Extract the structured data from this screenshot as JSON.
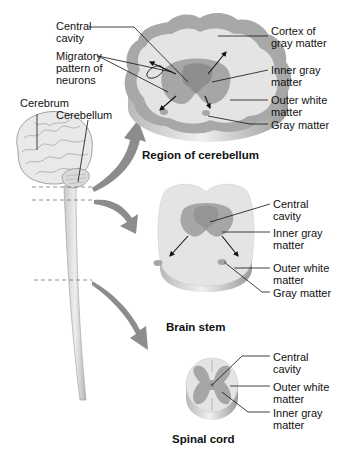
{
  "diagram": {
    "colors": {
      "white_matter": "#e4e4e4",
      "gray_matter": "#a6a6a6",
      "dark_gray": "#8a8a8a",
      "arrow_fill": "#8c8c8c",
      "line": "#111111",
      "background": "#ffffff"
    },
    "brain_labels": {
      "cerebrum": "Cerebrum",
      "cerebellum": "Cerebellum"
    },
    "sections": {
      "cerebellum": {
        "caption": "Region of cerebellum",
        "left_labels": {
          "central_cavity": "Central\ncavity",
          "migratory_pattern": "Migratory\npattern of\nneurons"
        },
        "right_labels": {
          "cortex": "Cortex of\ngray matter",
          "inner_gray": "Inner gray\nmatter",
          "outer_white": "Outer white\nmatter",
          "gray_matter": "Gray matter"
        }
      },
      "brain_stem": {
        "caption": "Brain stem",
        "right_labels": {
          "central_cavity": "Central\ncavity",
          "inner_gray": "Inner gray\nmatter",
          "outer_white": "Outer white\nmatter",
          "gray_matter": "Gray matter"
        }
      },
      "spinal_cord": {
        "caption": "Spinal cord",
        "right_labels": {
          "central_cavity": "Central\ncavity",
          "outer_white": "Outer white\nmatter",
          "inner_gray": "Inner gray\nmatter"
        }
      }
    }
  }
}
